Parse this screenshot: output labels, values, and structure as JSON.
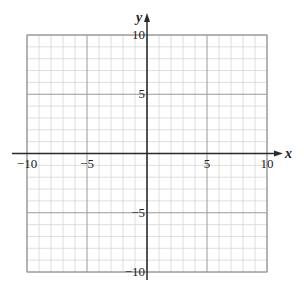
{
  "chart_data": {
    "type": "scatter",
    "title": "",
    "xlabel": "x",
    "ylabel": "y",
    "xlim": [
      -10,
      10
    ],
    "ylim": [
      -10,
      10
    ],
    "grid": true,
    "grid_minor_step": 1,
    "grid_major_step": 5,
    "x_ticks": [
      -10,
      -5,
      5,
      10
    ],
    "y_ticks": [
      10,
      5,
      -5,
      -10
    ],
    "x_tick_labels": [
      "−10",
      "−5",
      "5",
      "10"
    ],
    "y_tick_labels": [
      "10",
      "5",
      "−5",
      "−10"
    ],
    "series": [],
    "legend": null
  },
  "labels": {
    "x_axis": "x",
    "y_axis": "y"
  },
  "colors": {
    "minor_grid": "#d6d6d6",
    "major_grid": "#9a9a9a",
    "axis": "#2a2a2a",
    "text": "#222222"
  }
}
